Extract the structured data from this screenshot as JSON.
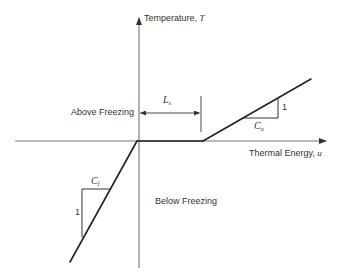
{
  "diagram": {
    "type": "piecewise-linear-phase-change",
    "y_axis": {
      "label": "Temperature, ",
      "symbol": "T"
    },
    "x_axis": {
      "label": "Thermal Energy, ",
      "symbol": "u"
    },
    "regions": {
      "above": "Above Freezing",
      "below": "Below Freezing"
    },
    "latent_heat": {
      "symbol": "L",
      "subscript": "s"
    },
    "frozen_slope": {
      "symbol": "C",
      "subscript": "f",
      "rise": "1"
    },
    "unfrozen_slope": {
      "symbol": "C",
      "subscript": "u",
      "rise": "1"
    },
    "colors": {
      "line": "#222222",
      "axis": "#555555",
      "background": "#ffffff"
    },
    "geometry": {
      "origin": [
        139,
        141
      ],
      "segments": [
        {
          "name": "frozen",
          "from": [
            70,
            262
          ],
          "to": [
            137,
            141
          ]
        },
        {
          "name": "latent",
          "from": [
            137,
            141
          ],
          "to": [
            203,
            141
          ]
        },
        {
          "name": "unfrozen",
          "from": [
            203,
            141
          ],
          "to": [
            311,
            79
          ]
        }
      ]
    }
  }
}
